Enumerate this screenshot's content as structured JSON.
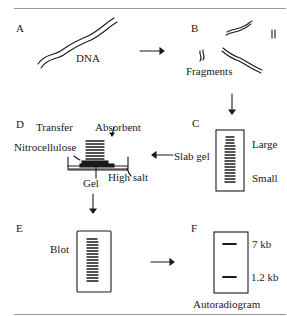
{
  "figure": {
    "panels": {
      "A": {
        "letter": "A",
        "labels": [
          "DNA"
        ]
      },
      "B": {
        "letter": "B",
        "labels": [
          "Fragments"
        ]
      },
      "C": {
        "letter": "C",
        "labels": [
          "Large",
          "Small",
          "Slab gel"
        ]
      },
      "D": {
        "letter": "D",
        "labels": [
          "Transfer",
          "Absorbent",
          "Nitrocellulose",
          "Gel",
          "High salt"
        ]
      },
      "E": {
        "letter": "E",
        "labels": [
          "Blot"
        ]
      },
      "F": {
        "letter": "F",
        "labels": [
          "7 kb",
          "1.2 kb",
          "Autoradiogram"
        ]
      }
    },
    "flow": [
      "A",
      "B",
      "C",
      "D",
      "E",
      "F"
    ],
    "colors": {
      "ink": "#1a1a1a",
      "rule": "#9a9a9a",
      "background": "#ffffff"
    }
  },
  "text": {
    "a": "A",
    "b": "B",
    "c": "C",
    "d": "D",
    "e": "E",
    "f": "F",
    "dna": "DNA",
    "fragments": "Fragments",
    "large": "Large",
    "small": "Small",
    "slab_gel": "Slab gel",
    "transfer": "Transfer",
    "absorbent": "Absorbent",
    "nitrocellulose": "Nitrocellulose",
    "gel": "Gel",
    "high_salt": "High salt",
    "blot": "Blot",
    "kb7": "7 kb",
    "kb12": "1.2 kb",
    "autoradiogram": "Autoradiogram"
  }
}
